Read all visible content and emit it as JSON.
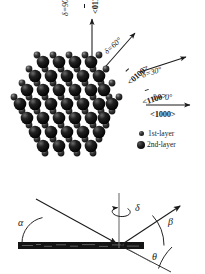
{
  "figure": {
    "title": "",
    "top_panel": {
      "description": "hexagonal close-packed surface lattice top view with azimuthal direction arrows",
      "legend": [
        {
          "marker": "small-filled-circle",
          "label": "1st-layer"
        },
        {
          "marker": "large-filled-circle",
          "label": "2nd-layer"
        }
      ],
      "directions": [
        {
          "delta": "δ=90°",
          "index": "<0110>",
          "overline_on": "0",
          "angle_deg": 90
        },
        {
          "delta": "δ=60°",
          "index": "<0100>",
          "overline_on": "0",
          "angle_deg": 60
        },
        {
          "delta": "δ=30°",
          "index": "<1100>",
          "overline_on": "1",
          "angle_deg": 30
        },
        {
          "delta": "δ = 0°",
          "index": "<1000>",
          "overline_on": "",
          "angle_deg": 0
        }
      ]
    },
    "bottom_panel": {
      "description": "side view scattering geometry at the surface",
      "angles": [
        {
          "symbol": "α",
          "meaning": "incident-angle"
        },
        {
          "symbol": "β",
          "meaning": "exit-angle"
        },
        {
          "symbol": "δ",
          "meaning": "azimuthal-rotation"
        },
        {
          "symbol": "θ",
          "meaning": "scattering-angle"
        }
      ],
      "surface_label": ""
    }
  },
  "chart_data": {
    "type": "diagram",
    "title": "",
    "lattice": {
      "type": "hcp-0001-surface",
      "layers": [
        "1st-layer",
        "2nd-layer"
      ],
      "second_layer_rows": [
        {
          "y": 62,
          "xs": [
            43,
            59,
            75,
            91
          ]
        },
        {
          "y": 76,
          "xs": [
            35,
            51,
            67,
            83,
            99
          ]
        },
        {
          "y": 90,
          "xs": [
            27,
            43,
            59,
            75,
            91,
            104
          ]
        },
        {
          "y": 104,
          "xs": [
            20,
            35,
            51,
            67,
            83,
            99,
            112
          ]
        },
        {
          "y": 118,
          "xs": [
            27,
            43,
            59,
            75,
            91,
            104
          ]
        },
        {
          "y": 132,
          "xs": [
            35,
            51,
            67,
            83,
            99
          ]
        },
        {
          "y": 146,
          "xs": [
            43,
            59,
            75,
            91
          ]
        }
      ],
      "first_layer_rows": [
        {
          "y": 55,
          "xs": [
            37,
            53,
            69,
            85,
            99
          ]
        },
        {
          "y": 69,
          "xs": [
            29,
            45,
            61,
            77,
            93,
            106
          ]
        },
        {
          "y": 83,
          "xs": [
            22,
            37,
            53,
            69,
            85,
            101,
            112
          ]
        },
        {
          "y": 97,
          "xs": [
            14,
            29,
            45,
            61,
            77,
            93,
            109,
            119
          ]
        },
        {
          "y": 111,
          "xs": [
            22,
            37,
            53,
            69,
            85,
            101,
            112
          ]
        },
        {
          "y": 125,
          "xs": [
            29,
            45,
            61,
            77,
            93,
            106
          ]
        },
        {
          "y": 139,
          "xs": [
            37,
            53,
            69,
            85,
            99
          ]
        },
        {
          "y": 153,
          "xs": [
            45,
            61,
            77,
            93
          ]
        }
      ]
    },
    "geometry": {
      "origin": [
        119,
        246
      ],
      "normal_top": [
        119,
        193
      ],
      "incident_from": [
        38,
        200
      ],
      "exit_to": [
        181,
        206
      ],
      "theta_to": [
        168,
        272
      ]
    }
  }
}
